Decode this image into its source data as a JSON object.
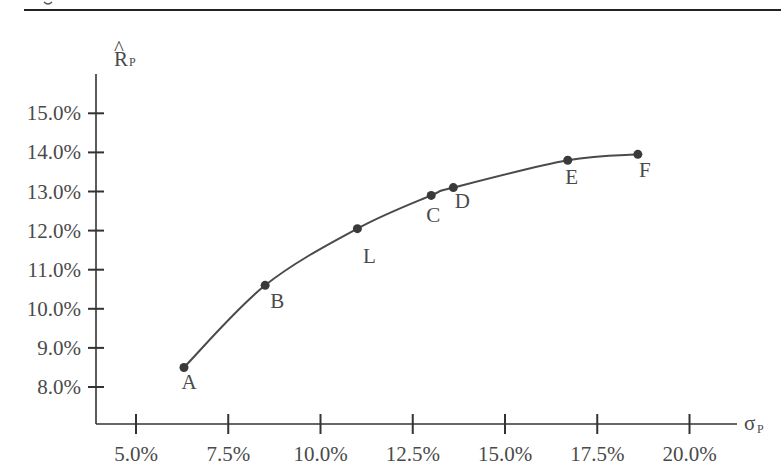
{
  "figure": {
    "top_rule": true
  },
  "chart_data": {
    "type": "line",
    "title": "",
    "xlabel": "σP",
    "ylabel": "R̂P",
    "xlabel_main": "σ",
    "xlabel_sub": "P",
    "ylabel_main": "R",
    "ylabel_sub": "P",
    "ylabel_hat": "^",
    "xlim": [
      4.0,
      21.0
    ],
    "ylim": [
      7.05,
      15.95
    ],
    "x_ticks": [
      5.0,
      7.5,
      10.0,
      12.5,
      15.0,
      17.5,
      20.0
    ],
    "x_tick_labels": [
      "5.0%",
      "7.5%",
      "10.0%",
      "12.5%",
      "15.0%",
      "17.5%",
      "20.0%"
    ],
    "y_ticks": [
      8.0,
      9.0,
      10.0,
      11.0,
      12.0,
      13.0,
      14.0,
      15.0
    ],
    "y_tick_labels": [
      "8.0%",
      "9.0%",
      "10.0%",
      "11.0%",
      "12.0%",
      "13.0%",
      "14.0%",
      "15.0%"
    ],
    "grid": false,
    "legend": null,
    "series": [
      {
        "name": "Efficient frontier",
        "curve": "smooth",
        "points": [
          {
            "label": "A",
            "x": 6.3,
            "y": 8.5
          },
          {
            "label": "B",
            "x": 8.5,
            "y": 10.6
          },
          {
            "label": "L",
            "x": 11.0,
            "y": 12.05
          },
          {
            "label": "C",
            "x": 13.0,
            "y": 12.9
          },
          {
            "label": "D",
            "x": 13.6,
            "y": 13.1
          },
          {
            "label": "E",
            "x": 16.7,
            "y": 13.8
          },
          {
            "label": "F",
            "x": 18.6,
            "y": 13.95
          }
        ]
      }
    ],
    "colors": {
      "line": "#4a4a4a",
      "points": "#3a3a3a",
      "axes": "#333333",
      "text": "#4a4a4a"
    }
  }
}
